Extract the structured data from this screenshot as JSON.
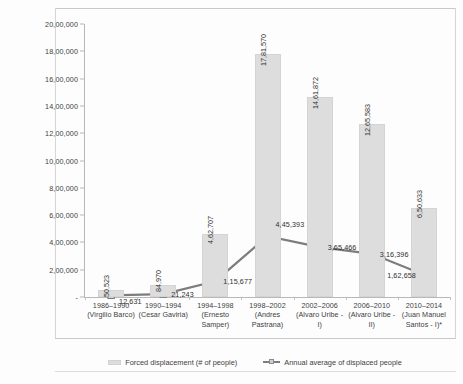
{
  "chart_data": {
    "type": "bar",
    "title": "",
    "subtitle": "",
    "xlabel": "",
    "ylabel": "",
    "ylim": [
      0,
      2000000
    ],
    "grid": false,
    "legend_position": "bottom-center",
    "number_format": "indian-lakh-grouping",
    "categories": [
      "1986–1990\n(Virgilio Barco)",
      "1990–1994\n(Cesar Gaviria)",
      "1994–1998\n(Ernesto\nSamper)",
      "1998–2002\n(Andres\nPastrana)",
      "2002–2006\n(Alvaro Uribe -\nI)",
      "2006–2010\n(Alvaro Uribe -\nII)",
      "2010–2014\n(Juan Manuel\nSantos - I)*"
    ],
    "category_periods": [
      "1986–1990",
      "1990–1994",
      "1994–1998",
      "1998–2002",
      "2002–2006",
      "2006–2010",
      "2010–2014"
    ],
    "category_presidents": [
      "(Virgilio Barco)",
      "(Cesar Gaviria)",
      "(Ernesto Samper)",
      "(Andres Pastrana)",
      "(Alvaro Uribe - I)",
      "(Alvaro Uribe - II)",
      "(Juan Manuel Santos - I)*"
    ],
    "series": [
      {
        "name": "Forced displacement (# of people)",
        "type": "bar",
        "color": "#dddddd",
        "values": [
          50523,
          84970,
          462707,
          1781570,
          1461872,
          1265583,
          650633
        ],
        "value_labels": [
          "50,523",
          "84,970",
          "4,62,707",
          "17,81,570",
          "14,61,872",
          "12,65,583",
          "6,50,633"
        ]
      },
      {
        "name": "Annual average of displaced people",
        "type": "line",
        "color": "#7d7d7d",
        "values": [
          12631,
          21243,
          115677,
          445393,
          365466,
          316396,
          162658
        ],
        "value_labels": [
          "12,631",
          "21,243",
          "1,15,677",
          "4,45,393",
          "3,65,466",
          "3,16,396",
          "1,62,658"
        ]
      }
    ],
    "ytick_labels": [
      "-",
      "2,00,000",
      "4,00,000",
      "6,00,000",
      "8,00,000",
      "10,00,000",
      "12,00,000",
      "14,00,000",
      "16,00,000",
      "18,00,000",
      "20,00,000"
    ],
    "ytick_values": [
      0,
      200000,
      400000,
      600000,
      800000,
      1000000,
      1200000,
      1400000,
      1600000,
      1800000,
      2000000
    ]
  },
  "legend": {
    "items": [
      {
        "label": "Forced displacement (# of people)",
        "marker": "bar-swatch-icon"
      },
      {
        "label": "Annual average of displaced people",
        "marker": "line-marker-icon"
      }
    ]
  }
}
